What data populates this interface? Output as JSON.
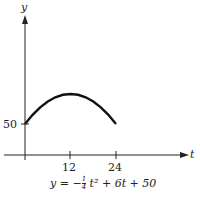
{
  "chart_data": {
    "type": "line",
    "title": "",
    "xlabel": "t",
    "ylabel": "y",
    "x_ticks": [
      "12",
      "24"
    ],
    "y_ticks": [
      "50"
    ],
    "x": [
      0,
      2,
      4,
      6,
      8,
      10,
      12,
      14,
      16,
      18,
      20,
      22,
      24
    ],
    "series": [
      {
        "name": "y = -1/4 t^2 + 6t + 50",
        "values": [
          50,
          61,
          70,
          77,
          82,
          85,
          86,
          85,
          82,
          77,
          70,
          61,
          50
        ]
      }
    ],
    "equation": {
      "lhs": "y = −",
      "frac_num": "1",
      "frac_den": "4",
      "rest": " t² + 6t + 50"
    },
    "xlim": [
      0,
      34
    ],
    "grid": false,
    "legend": "none"
  }
}
